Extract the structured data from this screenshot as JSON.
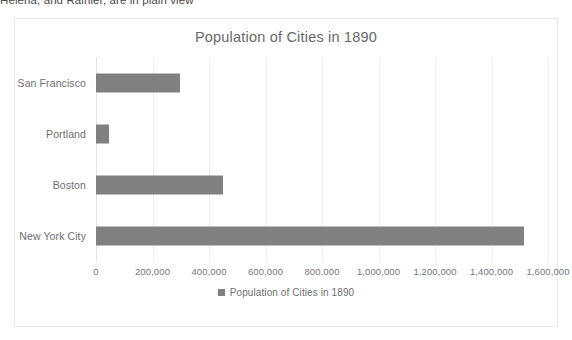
{
  "page": {
    "body_text": "Helena, and Rainier, are in plain view"
  },
  "chart": {
    "title": "Population of Cities in 1890",
    "legend_label": "Population of Cities in 1890",
    "bar_color": "#808080",
    "gridline_color": "#f0f0f2",
    "frame_border_color": "#e8e8ea",
    "title_color": "#676767",
    "label_color": "#6f6f6f"
  },
  "chart_data": {
    "type": "bar",
    "orientation": "horizontal",
    "title": "Population of Cities in 1890",
    "xlabel": "",
    "ylabel": "",
    "categories": [
      "San Francisco",
      "Portland",
      "Boston",
      "New York City"
    ],
    "values": [
      298997,
      46385,
      448477,
      1515301
    ],
    "series": [
      {
        "name": "Population of Cities in 1890",
        "values": [
          298997,
          46385,
          448477,
          1515301
        ]
      }
    ],
    "xlim": [
      0,
      1600000
    ],
    "xticks": [
      0,
      200000,
      400000,
      600000,
      800000,
      1000000,
      1200000,
      1400000,
      1600000
    ],
    "xtick_labels": [
      "0",
      "200,000",
      "400,000",
      "600,000",
      "800,000",
      "1,000,000",
      "1,200,000",
      "1,400,000",
      "1,600,000"
    ],
    "grid": true,
    "grid_axis": "x",
    "legend": true,
    "legend_position": "bottom"
  }
}
